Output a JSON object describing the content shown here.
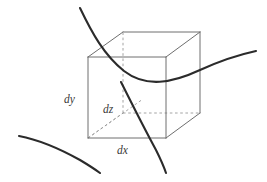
{
  "figure": {
    "name": "differential-volume-element",
    "width": 267,
    "height": 182,
    "background_color": "#ffffff"
  },
  "colors": {
    "background": "#ffffff",
    "edge_visible": "#6e6e6e",
    "edge_hidden": "#9a9a9a",
    "leader_dashed": "#9a9a9a",
    "curve": "#2b2b2b",
    "label_text": "#3a3a3a"
  },
  "labels": [
    {
      "id": "dy",
      "text": "dy",
      "x": 64,
      "y": 103,
      "anchor": "start",
      "meaning": "vertical edge length of volume element"
    },
    {
      "id": "dz",
      "text": "dz",
      "x": 103,
      "y": 113,
      "anchor": "start",
      "meaning": "depth edge length of volume element"
    },
    {
      "id": "dx",
      "text": "dx",
      "x": 117,
      "y": 154,
      "anchor": "start",
      "meaning": "horizontal edge length of volume element"
    }
  ],
  "cube": {
    "projection": "oblique",
    "front_face": {
      "top_left": [
        88,
        57
      ],
      "top_right": [
        166,
        57
      ],
      "bottom_right": [
        166,
        138
      ],
      "bottom_left": [
        88,
        138
      ]
    },
    "back_face": {
      "top_left": [
        123,
        32
      ],
      "top_right": [
        200,
        32
      ],
      "bottom_right": [
        200,
        113
      ],
      "bottom_left": [
        123,
        113
      ]
    },
    "visible_edges": [
      "front-top",
      "front-right",
      "front-bottom",
      "front-left",
      "back-top",
      "back-right",
      "back-bottom-right",
      "connector-top-left",
      "connector-top-right",
      "connector-bottom-right"
    ],
    "hidden_edges": [
      "back-vertical-left",
      "back-bottom-left",
      "connector-bottom-left"
    ]
  },
  "curves": [
    {
      "id": "upper-field-line",
      "path": "M 80,8 C 92,33 104,55 124,71 C 146,88 172,83 200,70 C 222,60 242,54 256,51",
      "description": "field line entering top-left, dipping through the cube, exiting right"
    },
    {
      "id": "through-field-line",
      "path": "M 121,82 C 130,100 143,126 156,150 C 161,160 164,167 166,173",
      "description": "field line descending steeply through the front face and out the bottom"
    },
    {
      "id": "lower-left-field-line",
      "path": "M 19,136 C 40,140 62,150 80,160 C 90,166 96,170 100,173",
      "description": "detached field line arc in the lower-left corner"
    }
  ],
  "dimension_leaders": [
    {
      "id": "dz-leader",
      "from": [
        88,
        138
      ],
      "to": [
        143,
        99
      ],
      "style": "dashed",
      "description": "dashed diagonal from front-bottom-left vertex toward the hidden back-bottom-left vertex"
    }
  ]
}
